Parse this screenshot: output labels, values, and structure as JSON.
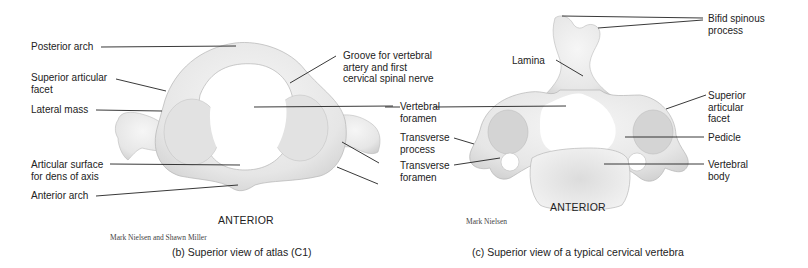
{
  "panel_b": {
    "caption": "(b) Superior view of atlas (C1)",
    "orientation": "ANTERIOR",
    "credit": "Mark Nielsen and Shawn Miller",
    "labels": {
      "posterior_arch": "Posterior arch",
      "superior_articular_facet": [
        "Superior articular",
        "facet"
      ],
      "lateral_mass": "Lateral mass",
      "articular_surface": [
        "Articular surface",
        "for dens of axis"
      ],
      "anterior_arch": "Anterior arch",
      "groove": [
        "Groove for vertebral",
        "artery and first",
        "cervical spinal nerve"
      ]
    }
  },
  "shared_labels": {
    "vertebral_foramen": [
      "Vertebral",
      "foramen"
    ],
    "transverse_process": [
      "Transverse",
      "process"
    ],
    "transverse_foramen": [
      "Transverse",
      "foramen"
    ]
  },
  "panel_c": {
    "caption": "(c) Superior view of a typical cervical vertebra",
    "orientation": "ANTERIOR",
    "credit": "Mark Nielsen",
    "labels": {
      "bifid_spinous_process": [
        "Bifid spinous",
        "process"
      ],
      "lamina": "Lamina",
      "superior_articular_facet": [
        "Superior",
        "articular",
        "facet"
      ],
      "pedicle": "Pedicle",
      "vertebral_body": [
        "Vertebral",
        "body"
      ]
    }
  },
  "colors": {
    "bone": "#ececec",
    "bone_shadow": "#c8c8c8",
    "leader": "#222222"
  }
}
